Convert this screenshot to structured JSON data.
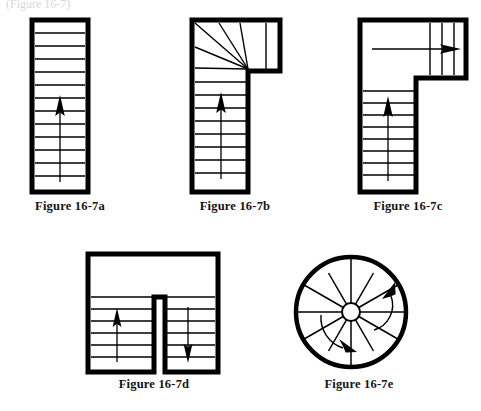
{
  "page": {
    "width": 481,
    "height": 411,
    "background": "#ffffff",
    "ink": "#000000",
    "ghost_text": "(Figure 16-7)"
  },
  "figures": [
    {
      "id": "fig-a",
      "caption": "Figure 16-7a",
      "type": "straight-run-stair",
      "description": "Straight run stair, single flight, arrow pointing up",
      "tread_count": 13,
      "arrow_direction": "up"
    },
    {
      "id": "fig-b",
      "caption": "Figure 16-7b",
      "type": "winder-stair",
      "description": "L-shaped stair with winder (pie-shaped) treads at the turn",
      "straight_tread_count": 9,
      "winder_tread_count": 5,
      "arrow_direction": "up"
    },
    {
      "id": "fig-c",
      "caption": "Figure 16-7c",
      "type": "l-shaped-stair-with-landing",
      "description": "L-shaped stair with a rectangular landing at the turn",
      "straight_tread_count": 10,
      "upper_tread_count": 3,
      "arrow_direction": "up-then-right"
    },
    {
      "id": "fig-d",
      "caption": "Figure 16-7d",
      "type": "u-shaped-switchback-stair",
      "description": "U-shaped (switchback) stair with intermediate landing at the top",
      "left_flight_tread_count": 6,
      "right_flight_tread_count": 6,
      "arrow_direction": "up-and-down"
    },
    {
      "id": "fig-e",
      "caption": "Figure 16-7e",
      "type": "spiral-stair",
      "description": "Circular spiral stair with radial treads around a center pole",
      "tread_count": 12,
      "arrow_direction": "counterclockwise"
    }
  ],
  "colors": {
    "ink": "#000000",
    "caption": "#141414",
    "paper": "#ffffff"
  }
}
